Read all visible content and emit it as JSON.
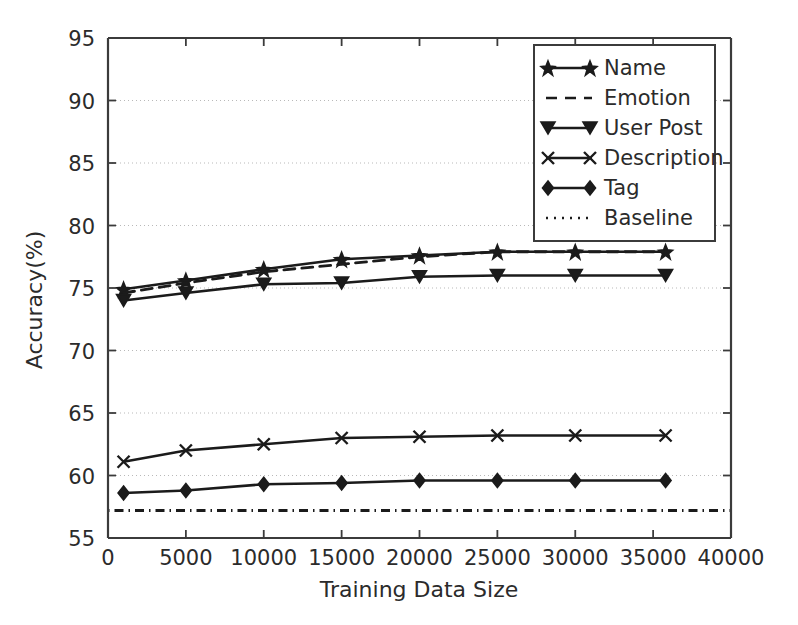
{
  "chart_data": {
    "type": "line",
    "title": "",
    "xlabel": "Training Data Size",
    "ylabel": "Accuracy(%)",
    "xlim": [
      0,
      40000
    ],
    "ylim": [
      55,
      95
    ],
    "xticks": [
      0,
      5000,
      10000,
      15000,
      20000,
      25000,
      30000,
      35000,
      40000
    ],
    "xticklabels": [
      "0",
      "5000",
      "10000",
      "15000",
      "20000",
      "25000",
      "30000",
      "35000",
      "40000"
    ],
    "yticks": [
      55,
      60,
      65,
      70,
      75,
      80,
      85,
      90,
      95
    ],
    "yticklabels": [
      "55",
      "60",
      "65",
      "70",
      "75",
      "80",
      "85",
      "90",
      "95"
    ],
    "grid": true,
    "grid_axis": "y",
    "legend_position": "upper right",
    "x": [
      1000,
      5000,
      10000,
      15000,
      20000,
      25000,
      30000,
      35800
    ],
    "series": [
      {
        "name": "Name",
        "linestyle": "solid",
        "marker": "star",
        "values": [
          74.9,
          75.6,
          76.5,
          77.3,
          77.6,
          77.9,
          77.9,
          77.9
        ]
      },
      {
        "name": "Emotion",
        "linestyle": "dashed",
        "marker": "none",
        "values": [
          74.6,
          75.4,
          76.3,
          76.9,
          77.5,
          77.9,
          77.9,
          77.9
        ]
      },
      {
        "name": "User Post",
        "linestyle": "solid",
        "marker": "triangle-down",
        "values": [
          74.0,
          74.6,
          75.3,
          75.4,
          75.9,
          76.0,
          76.0,
          76.0
        ]
      },
      {
        "name": "Description",
        "linestyle": "solid",
        "marker": "x",
        "values": [
          61.1,
          62.0,
          62.5,
          63.0,
          63.1,
          63.2,
          63.2,
          63.2
        ]
      },
      {
        "name": "Tag",
        "linestyle": "solid",
        "marker": "diamond",
        "values": [
          58.6,
          58.8,
          59.3,
          59.4,
          59.6,
          59.6,
          59.6,
          59.6
        ]
      },
      {
        "name": "Baseline",
        "linestyle": "dashdot",
        "marker": "none",
        "constant": 57.2,
        "x": [
          0,
          40000
        ],
        "values": [
          57.2,
          57.2
        ]
      }
    ]
  },
  "legend": {
    "items": [
      {
        "label": "Name"
      },
      {
        "label": "Emotion"
      },
      {
        "label": "User Post"
      },
      {
        "label": "Description"
      },
      {
        "label": "Tag"
      },
      {
        "label": "Baseline"
      }
    ]
  },
  "axes": {
    "x_title": "Training Data Size",
    "y_title": "Accuracy(%)"
  }
}
